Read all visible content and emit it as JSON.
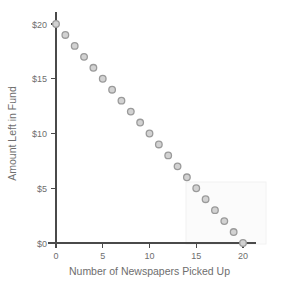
{
  "chart_data": {
    "type": "scatter",
    "title": "",
    "xlabel": "Number of Newspapers Picked Up",
    "ylabel": "Amount Left in Fund",
    "xlim": [
      0,
      20
    ],
    "ylim": [
      0,
      20
    ],
    "xticks": [
      0,
      5,
      10,
      15,
      20
    ],
    "xticklabels": [
      "0",
      "5",
      "10",
      "15",
      "20"
    ],
    "yticks": [
      0,
      5,
      10,
      15,
      20
    ],
    "yticklabels": [
      "$0",
      "$5",
      "$10",
      "$15",
      "$20"
    ],
    "grid": false,
    "legend": null,
    "marker": "open-circle",
    "marker_fill": "#d2d2d2",
    "marker_edge": "#9a9a9a",
    "axis_color": "#4a4a4a",
    "text_color": "#6e6e6e",
    "background": "#ffffff",
    "x": [
      0,
      1,
      2,
      3,
      4,
      5,
      6,
      7,
      8,
      9,
      10,
      11,
      12,
      13,
      14,
      15,
      16,
      17,
      18,
      19,
      20
    ],
    "values": [
      20,
      19,
      18,
      17,
      16,
      15,
      14,
      13,
      12,
      11,
      10,
      9,
      8,
      7,
      6,
      5,
      4,
      3,
      2,
      1,
      0
    ],
    "points": [
      {
        "x": 0,
        "y": 20
      },
      {
        "x": 1,
        "y": 19
      },
      {
        "x": 2,
        "y": 18
      },
      {
        "x": 3,
        "y": 17
      },
      {
        "x": 4,
        "y": 16
      },
      {
        "x": 5,
        "y": 15
      },
      {
        "x": 6,
        "y": 14
      },
      {
        "x": 7,
        "y": 13
      },
      {
        "x": 8,
        "y": 12
      },
      {
        "x": 9,
        "y": 11
      },
      {
        "x": 10,
        "y": 10
      },
      {
        "x": 11,
        "y": 9
      },
      {
        "x": 12,
        "y": 8
      },
      {
        "x": 13,
        "y": 7
      },
      {
        "x": 14,
        "y": 6
      },
      {
        "x": 15,
        "y": 5
      },
      {
        "x": 16,
        "y": 4
      },
      {
        "x": 17,
        "y": 3
      },
      {
        "x": 18,
        "y": 2
      },
      {
        "x": 19,
        "y": 1
      },
      {
        "x": 20,
        "y": 0
      }
    ]
  }
}
